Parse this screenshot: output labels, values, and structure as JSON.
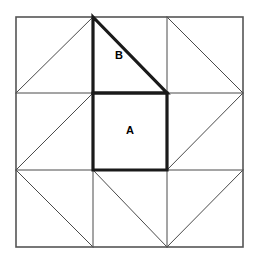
{
  "figure": {
    "canvas": {
      "width": 257,
      "height": 263
    },
    "colors": {
      "background": "#ffffff",
      "thin_line": "#4a4a4a",
      "outer_border": "#555555",
      "bold_line": "#1a1a1a",
      "label_text": "#000000"
    },
    "stroke_widths": {
      "thin": 1,
      "outer": 1.6,
      "bold": 3.2
    },
    "grid": {
      "columns": 3,
      "rows": 3,
      "x_positions": [
        16,
        93,
        167,
        243
      ],
      "y_positions": [
        17,
        93,
        170,
        247
      ]
    },
    "cells": [
      {
        "name": "top-left",
        "row": 0,
        "col": 0,
        "diagonal": "anti",
        "bold": false,
        "label": ""
      },
      {
        "name": "top-center",
        "row": 0,
        "col": 1,
        "diagonal": "main",
        "bold": true,
        "label": "B"
      },
      {
        "name": "top-right",
        "row": 0,
        "col": 2,
        "diagonal": "main",
        "bold": false,
        "label": ""
      },
      {
        "name": "middle-left",
        "row": 1,
        "col": 0,
        "diagonal": "anti",
        "bold": false,
        "label": ""
      },
      {
        "name": "middle-center",
        "row": 1,
        "col": 1,
        "diagonal": "none",
        "bold": true,
        "label": "A"
      },
      {
        "name": "middle-right",
        "row": 1,
        "col": 2,
        "diagonal": "anti",
        "bold": false,
        "label": ""
      },
      {
        "name": "bottom-left",
        "row": 2,
        "col": 0,
        "diagonal": "main",
        "bold": false,
        "label": ""
      },
      {
        "name": "bottom-center",
        "row": 2,
        "col": 1,
        "diagonal": "main",
        "bold": false,
        "label": ""
      },
      {
        "name": "bottom-right",
        "row": 2,
        "col": 2,
        "diagonal": "anti",
        "bold": false,
        "label": ""
      }
    ],
    "labels": {
      "triangle_b": {
        "text": "B",
        "x": 119,
        "y": 56,
        "shape": "right-triangle",
        "description": "Bold right triangle occupying the upper-left half of the top-middle cell"
      },
      "square_a": {
        "text": "A",
        "x": 130,
        "y": 131,
        "shape": "square",
        "description": "Bold square occupying the entire centre cell"
      }
    },
    "bold_shapes": {
      "triangle_b_points": "93,17 167,93 93,93",
      "square_a_points": "93,93 167,93 167,170 93,170"
    }
  }
}
